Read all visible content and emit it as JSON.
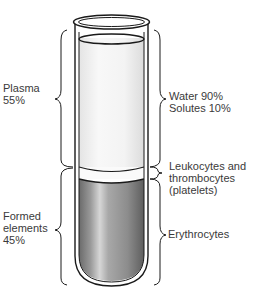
{
  "diagram": {
    "left_labels": {
      "plasma": {
        "line1": "Plasma",
        "line2": "55%"
      },
      "formed_elements": {
        "line1": "Formed",
        "line2": "elements",
        "line3": "45%"
      }
    },
    "right_labels": {
      "plasma_composition": {
        "line1": "Water 90%",
        "line2": "Solutes 10%"
      },
      "buffy_coat": {
        "line1": "Leukocytes and",
        "line2": "thrombocytes",
        "line3": "(platelets)"
      },
      "red_cells": {
        "line1": "Erythrocytes"
      }
    },
    "colors": {
      "plasma": "#f4f4f4",
      "buffy_coat": "#f9f9f9",
      "erythrocytes_dark": "#6e6e6e",
      "erythrocytes_light": "#c8c8c8",
      "outline": "#1a1a1a",
      "text": "#3a3a3a"
    }
  }
}
